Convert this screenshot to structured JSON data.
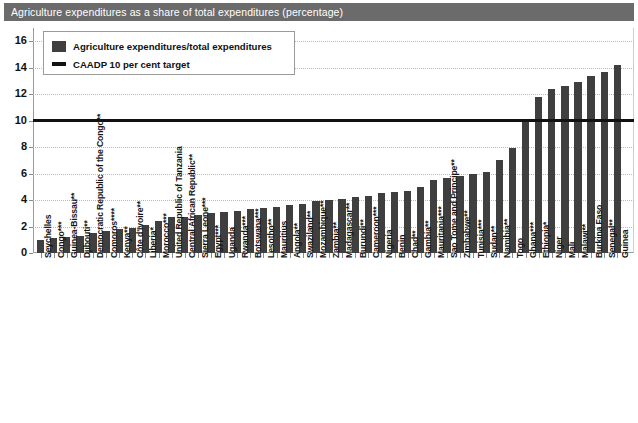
{
  "title": "Agriculture expenditures as a share of total expenditures (percentage)",
  "legend": {
    "series_label": "Agriculture expenditures/total expenditures",
    "target_label": "CAADP 10 per cent target"
  },
  "colors": {
    "bar": "#3f3f3f",
    "target_line": "#111111",
    "title_banner": "#6b6b6b",
    "gridline": "#b9b9b9",
    "axis": "#9a9a9a"
  },
  "chart_data": {
    "type": "bar",
    "title": "Agriculture expenditures as a share of total expenditures (percentage)",
    "xlabel": "",
    "ylabel": "",
    "ylim": [
      0,
      17
    ],
    "yticks": [
      0,
      2,
      4,
      6,
      8,
      10,
      12,
      14,
      16
    ],
    "grid": true,
    "legend_position": "top-left",
    "series_name": "Agriculture expenditures/total expenditures",
    "annotations": [
      {
        "type": "hline",
        "value": 10,
        "label": "CAADP 10 per cent target"
      }
    ],
    "categories": [
      "Seychelles",
      "Congo***",
      "Guinea-Bissau**",
      "Djibouti**",
      "Democratic Republic of the Congo**",
      "Comoros****",
      "Kenya**",
      "Côte d'Ivoire**",
      "Liberia*",
      "Morocco***",
      "United Republic of Tanzania",
      "Central African Republic**",
      "Sierra Leone***",
      "Egypt***",
      "Uganda",
      "Rwanda***",
      "Botswana***",
      "Lesotho**",
      "Mauritius",
      "Angola**",
      "Swaziland**",
      "Mozambique**",
      "Zambia**",
      "Madagascar**",
      "Burundi**",
      "Cameroon***",
      "Nigeria",
      "Benin",
      "Chad**",
      "Gambia**",
      "Mauritania***",
      "Sao Tome and Principe**",
      "Zimbabwe**",
      "Tunisia***",
      "Sudan**",
      "Namibia**",
      "Togo",
      "Ghana***",
      "Ethiopia*",
      "Niger",
      "Mali",
      "Malawi**",
      "Burkina Faso",
      "Senegal**",
      "Guinea"
    ],
    "values": [
      1.0,
      1.1,
      1.2,
      1.3,
      1.5,
      1.7,
      1.8,
      1.9,
      2.1,
      2.4,
      2.7,
      2.7,
      2.9,
      3.0,
      3.1,
      3.2,
      3.3,
      3.4,
      3.5,
      3.6,
      3.7,
      3.9,
      4.0,
      4.1,
      4.2,
      4.3,
      4.5,
      4.6,
      4.7,
      5.0,
      5.5,
      5.7,
      5.8,
      6.0,
      6.1,
      7.0,
      7.9,
      10.0,
      11.8,
      12.4,
      12.6,
      12.9,
      13.4,
      13.7,
      14.2
    ]
  }
}
